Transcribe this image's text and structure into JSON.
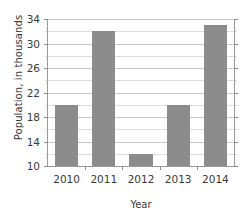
{
  "chart_data": {
    "type": "bar",
    "title": "",
    "subtitle": "",
    "xlabel": "Year",
    "ylabel": "Population, in thousands",
    "categories": [
      "2010",
      "2011",
      "2012",
      "2013",
      "2014"
    ],
    "values": [
      20,
      32,
      12,
      20,
      33
    ],
    "series": [
      {
        "name": "Population",
        "values": [
          20,
          32,
          12,
          20,
          33
        ]
      }
    ],
    "ylim": [
      10,
      34
    ],
    "xlim": [
      0,
      5
    ],
    "y_ticks": [
      10,
      14,
      18,
      22,
      26,
      30,
      34
    ],
    "y_tick_labels": [
      "10",
      "14",
      "18",
      "22",
      "26",
      "30",
      "34"
    ],
    "y_minor_ticks": [
      12,
      16,
      20,
      24,
      28,
      32
    ],
    "x_tick_labels": [
      "2010",
      "2011",
      "2012",
      "2013",
      "2014"
    ],
    "grid": true,
    "grid_axis": "y",
    "legend": false,
    "legend_position": "none",
    "annotations": [],
    "bar_color": "#8c8c8c",
    "grid_color": "#c9c9c9",
    "axis_color": "#9a9a9a",
    "text_color": "#3a3a3a",
    "background_color": "#ffffff"
  }
}
